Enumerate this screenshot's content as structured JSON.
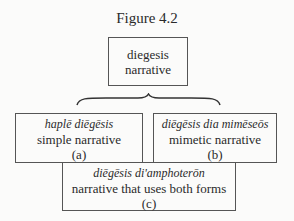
{
  "figure": {
    "title": "Figure 4.2",
    "top_box": {
      "line1": "diegesis",
      "line2": "narrative"
    },
    "box_a": {
      "term": "haplē diēgēsis",
      "gloss": "simple narrative",
      "label": "(a)"
    },
    "box_b": {
      "term": "diēgēsis dia mimēseōs",
      "gloss": "mimetic narrative",
      "label": "(b)"
    },
    "box_c": {
      "term": "diēgēsis di'amphoterōn",
      "gloss": "narrative that uses both forms",
      "label": "(c)"
    }
  }
}
